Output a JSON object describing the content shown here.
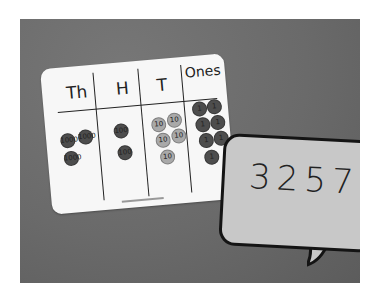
{
  "scene": {
    "description": "Photo of a place value chart card with counters and a speech bubble showing the number",
    "background_color": "#6e6e6e"
  },
  "place_value_chart": {
    "headers": [
      "Th",
      "H",
      "T",
      "Ones"
    ],
    "columns": [
      {
        "header": "Th",
        "counter_count": 3,
        "counter_shade": "dark",
        "counter_labels": [
          "1000",
          "1000",
          "1000"
        ]
      },
      {
        "header": "H",
        "counter_count": 2,
        "counter_shade": "dark",
        "counter_labels": [
          "100",
          "100"
        ]
      },
      {
        "header": "T",
        "counter_count": 5,
        "counter_shade": "light",
        "counter_labels": [
          "10",
          "10",
          "10",
          "10",
          "10"
        ]
      },
      {
        "header": "Ones",
        "counter_count": 7,
        "counter_shade": "dark",
        "counter_labels": [
          "1",
          "1",
          "1",
          "1",
          "1",
          "1",
          "1"
        ]
      }
    ]
  },
  "speech_bubble": {
    "number": "3257"
  }
}
